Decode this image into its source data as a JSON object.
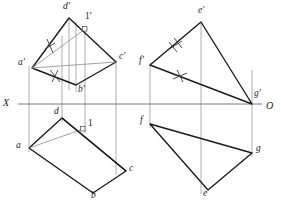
{
  "drawing": {
    "title": "Orthographic projection — two-view descriptive geometry exercise",
    "axis": {
      "name": "ground-line",
      "left_label": "X",
      "right_label": "O",
      "y": 104,
      "x_start": 18,
      "x_end": 262,
      "color": "#6b6b6b"
    },
    "colors": {
      "object_line": "#1a1a1a",
      "thin_line": "#7a7a7a",
      "projector_line": "#8c8c8c",
      "background": "#ffffff",
      "text": "#1a1a1a"
    },
    "left_figure": {
      "name": "quadrilateral-abcd",
      "front_view": {
        "name": "front-view-abcd",
        "vertices": [
          {
            "label": "a'",
            "x": 32,
            "y": 68,
            "label_x": 20,
            "label_y": 61
          },
          {
            "label": "d'",
            "x": 69,
            "y": 18,
            "label_x": 63,
            "label_y": 5
          },
          {
            "label": "c'",
            "x": 116,
            "y": 62,
            "label_x": 120,
            "label_y": 55
          },
          {
            "label": "b'",
            "x": 76,
            "y": 85,
            "label_x": 79,
            "label_y": 87
          }
        ],
        "interior_point": {
          "label": "1'",
          "x": 85,
          "y": 29,
          "label_x": 86,
          "label_y": 15
        }
      },
      "top_view": {
        "name": "top-view-abcd",
        "vertices": [
          {
            "label": "a",
            "x": 29,
            "y": 148,
            "label_x": 18,
            "label_y": 143
          },
          {
            "label": "d",
            "x": 62,
            "y": 118,
            "label_x": 55,
            "label_y": 108
          },
          {
            "label": "c",
            "x": 126,
            "y": 171,
            "label_x": 130,
            "label_y": 166
          },
          {
            "label": "b",
            "x": 93,
            "y": 193,
            "label_x": 92,
            "label_y": 190
          }
        ],
        "interior_point": {
          "label": "1",
          "x": 83,
          "y": 129,
          "label_x": 87,
          "label_y": 118
        }
      },
      "projectors": [
        {
          "x": 29,
          "y1": 68,
          "y2": 148
        },
        {
          "x": 62,
          "y1": 40,
          "y2": 118
        },
        {
          "x": 69,
          "y1": 18,
          "y2": 85
        },
        {
          "x": 76,
          "y1": 18,
          "y2": 90
        },
        {
          "x": 85,
          "y1": 29,
          "y2": 129
        },
        {
          "x": 116,
          "y1": 62,
          "y2": 171
        }
      ],
      "tick_marks": [
        {
          "name": "equal-mark-ad",
          "x": 50,
          "y": 43,
          "count": 1
        },
        {
          "name": "equal-mark-ab",
          "x": 55,
          "y": 76,
          "count": 1
        }
      ]
    },
    "right_figure": {
      "name": "triangle-efg",
      "front_view": {
        "name": "front-view-efg",
        "vertices": [
          {
            "label": "e'",
            "x": 201,
            "y": 22,
            "label_x": 200,
            "label_y": 9
          },
          {
            "label": "f'",
            "x": 150,
            "y": 65,
            "label_x": 140,
            "label_y": 59
          },
          {
            "label": "g'",
            "x": 252,
            "y": 104,
            "label_x": 255,
            "label_y": 92
          }
        ]
      },
      "top_view": {
        "name": "top-view-efg",
        "vertices": [
          {
            "label": "f",
            "x": 150,
            "y": 124,
            "label_x": 140,
            "label_y": 119
          },
          {
            "label": "g",
            "x": 252,
            "y": 153,
            "label_x": 256,
            "label_y": 146
          },
          {
            "label": "e",
            "x": 208,
            "y": 190,
            "label_x": 204,
            "label_y": 189
          }
        ]
      },
      "projectors": [
        {
          "x": 150,
          "y1": 65,
          "y2": 124
        },
        {
          "x": 201,
          "y1": 22,
          "y2": 190
        },
        {
          "x": 252,
          "y1": 72,
          "y2": 153
        }
      ],
      "tick_marks": [
        {
          "name": "double-equal-mark-ef",
          "x": 174,
          "y": 45,
          "count": 2
        },
        {
          "name": "equal-mark-fg",
          "x": 180,
          "y": 75,
          "count": 1
        }
      ]
    }
  }
}
